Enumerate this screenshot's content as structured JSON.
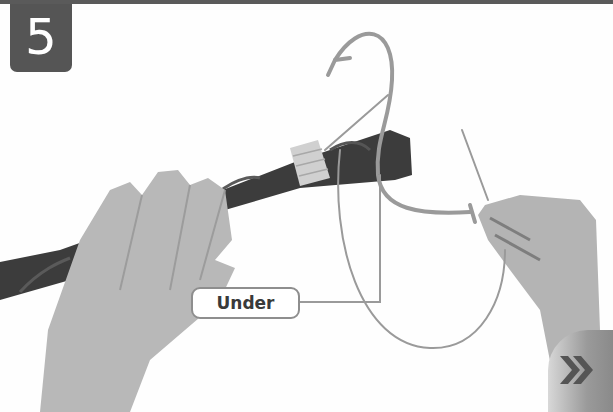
{
  "step": {
    "number": "5"
  },
  "labels": {
    "under": "Under"
  },
  "navigation": {
    "next_icon": "double-chevron-right-icon"
  },
  "colors": {
    "badge": "#555555",
    "rule": "#5a5a5a",
    "guide_line": "#9a9a9a",
    "label_border": "#8e8e8e",
    "rope": "#3c3c3c",
    "whipping": "#d0d0d0",
    "skin": "#b8b8b8"
  }
}
